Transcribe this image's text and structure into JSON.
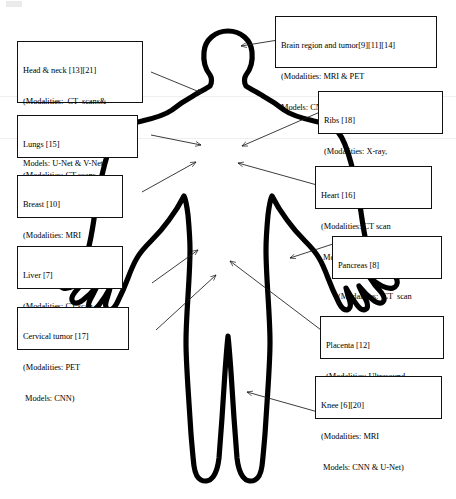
{
  "figure": {
    "type": "anatomical-annotation-diagram"
  },
  "colors": {
    "body_outline": "#000000",
    "box_border": "#111111",
    "background": "#ffffff",
    "arrow": "#1a1a1a",
    "text": "#000000"
  },
  "annotations": [
    {
      "id": "head-neck",
      "lines": [
        "Head & neck [13][21]",
        "(Modalities:  CT  scans&",
        "PET-CT",
        "Models: U-Net & V-Net)"
      ],
      "region": "Head & neck",
      "citations": [
        "13",
        "21"
      ],
      "modalities": "CT scans & PET-CT",
      "models": "U-Net & V-Net"
    },
    {
      "id": "brain",
      "lines": [
        "Brain region and tumor[9][11][14]",
        "(Modalities: MRI & PET",
        "Models: CNN & U-Net)"
      ],
      "region": "Brain region and tumor",
      "citations": [
        "9",
        "11",
        "14"
      ],
      "modalities": "MRI & PET",
      "models": "CNN & U-Net"
    },
    {
      "id": "lungs",
      "lines": [
        "Lungs [15]",
        "(Modalities: CT scans",
        " Models: U-Net)"
      ],
      "region": "Lungs",
      "citations": [
        "15"
      ],
      "modalities": "CT scans",
      "models": "U-Net"
    },
    {
      "id": "ribs",
      "lines": [
        "Ribs [18]",
        "(Modalities: X-ray,",
        " Models:Mask R-CNN)"
      ],
      "region": "Ribs",
      "citations": [
        "18"
      ],
      "modalities": "X-ray",
      "models": "Mask R-CNN"
    },
    {
      "id": "breast",
      "lines": [
        "Breast [10]",
        "(Modalities: MRI",
        " Models: U-Net)"
      ],
      "region": "Breast",
      "citations": [
        "10"
      ],
      "modalities": "MRI",
      "models": "U-Net"
    },
    {
      "id": "heart",
      "lines": [
        "Heart [16]",
        "(Modalities: CT scan",
        " Models:U-Net)"
      ],
      "region": "Heart",
      "citations": [
        "16"
      ],
      "modalities": "CT scan",
      "models": "U-Net"
    },
    {
      "id": "liver",
      "lines": [
        "Liver [7]",
        "(Modalities: CT scan",
        " Models: CNN)"
      ],
      "region": "Liver",
      "citations": [
        "7"
      ],
      "modalities": "CT scan",
      "models": "CNN"
    },
    {
      "id": "pancreas",
      "lines": [
        "Pancreas [8]",
        "(Modalities:  CT  scan",
        "Models: CNN)"
      ],
      "region": "Pancreas",
      "citations": [
        "8"
      ],
      "modalities": "CT scan",
      "models": "CNN"
    },
    {
      "id": "cervical-tumor",
      "lines": [
        "Cervical tumor [17]",
        "(Modalities: PET",
        " Models: CNN)"
      ],
      "region": "Cervical tumor",
      "citations": [
        "17"
      ],
      "modalities": "PET",
      "models": "CNN"
    },
    {
      "id": "placenta",
      "lines": [
        "Placenta [12]",
        "(Modalities: Ultrasound",
        "Models: CNN)"
      ],
      "region": "Placenta",
      "citations": [
        "12"
      ],
      "modalities": "Ultrasound",
      "models": "CNN"
    },
    {
      "id": "knee",
      "lines": [
        "Knee [6][20]",
        "(Modalities: MRI",
        " Models: CNN & U-Net)"
      ],
      "region": "Knee",
      "citations": [
        "6",
        "20"
      ],
      "modalities": "MRI",
      "models": "CNN & U-Net"
    }
  ]
}
